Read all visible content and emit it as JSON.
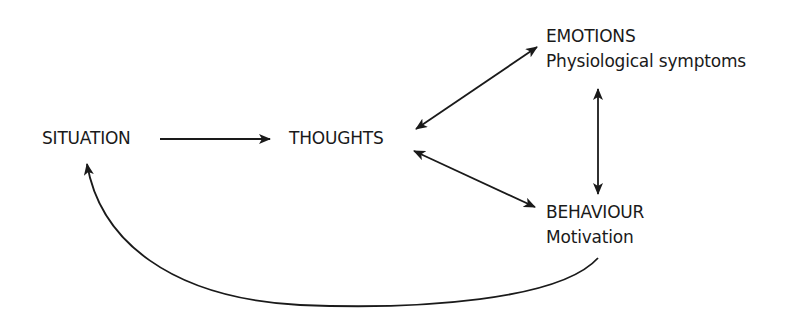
{
  "diagram": {
    "type": "cbt-cycle",
    "nodes": {
      "situation": {
        "title": "SITUATION"
      },
      "thoughts": {
        "title": "THOUGHTS"
      },
      "emotions": {
        "title": "EMOTIONS",
        "subtitle": "Physiological symptoms"
      },
      "behaviour": {
        "title": "BEHAVIOUR",
        "subtitle": "Motivation"
      }
    },
    "edges": [
      {
        "from": "SITUATION",
        "to": "THOUGHTS",
        "direction": "one-way"
      },
      {
        "from": "THOUGHTS",
        "to": "EMOTIONS",
        "direction": "two-way"
      },
      {
        "from": "THOUGHTS",
        "to": "BEHAVIOUR",
        "direction": "two-way"
      },
      {
        "from": "EMOTIONS",
        "to": "BEHAVIOUR",
        "direction": "two-way"
      },
      {
        "from": "BEHAVIOUR",
        "to": "SITUATION",
        "direction": "one-way",
        "style": "curved"
      }
    ],
    "colors": {
      "ink": "#1a1a1a",
      "background": "#ffffff"
    }
  }
}
